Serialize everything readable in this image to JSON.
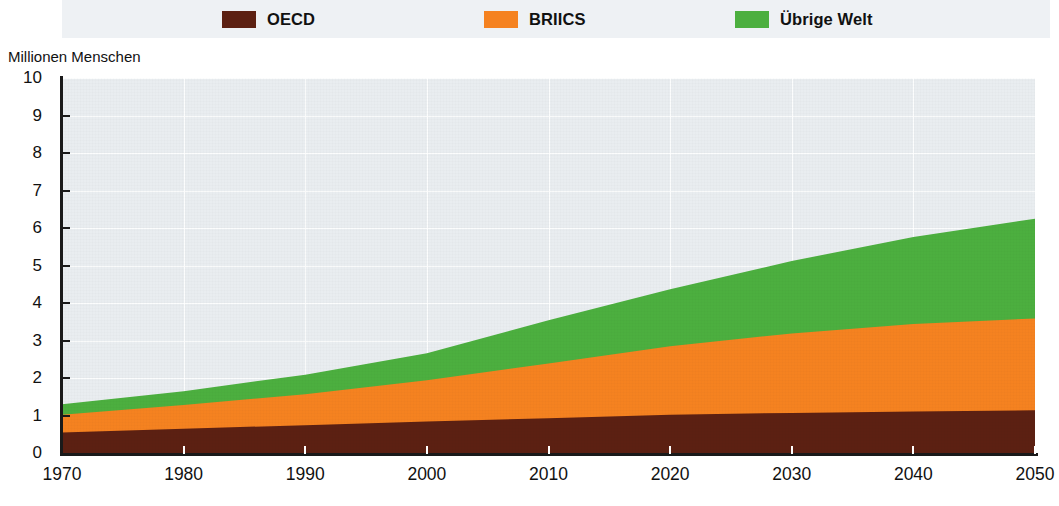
{
  "legend": {
    "items": [
      {
        "label": "OECD",
        "color": "#5c2012",
        "swatch_name": "legend-swatch-oecd"
      },
      {
        "label": "BRIICS",
        "color": "#f58220",
        "swatch_name": "legend-swatch-briics"
      },
      {
        "label": "Übrige Welt",
        "color": "#4caf3f",
        "swatch_name": "legend-swatch-uebrige-welt"
      }
    ]
  },
  "axes": {
    "ylabel": "Millionen Menschen",
    "yticks": [
      "10",
      "9",
      "8",
      "7",
      "6",
      "5",
      "4",
      "3",
      "2",
      "1",
      "0"
    ],
    "xticks": [
      "1970",
      "1980",
      "1990",
      "2000",
      "2010",
      "2020",
      "2030",
      "2040",
      "2050"
    ]
  },
  "chart_data": {
    "type": "area",
    "stacked": true,
    "title": "",
    "subtitle": "",
    "xlabel": "",
    "ylabel": "Millionen Menschen",
    "xlim": [
      1970,
      2050
    ],
    "ylim": [
      0,
      10
    ],
    "grid": true,
    "legend_position": "top",
    "x": [
      1970,
      1980,
      1990,
      2000,
      2010,
      2020,
      2030,
      2040,
      2050
    ],
    "series": [
      {
        "name": "OECD",
        "color": "#5c2012",
        "values": [
          0.55,
          0.65,
          0.74,
          0.84,
          0.93,
          1.02,
          1.07,
          1.11,
          1.14
        ]
      },
      {
        "name": "BRIICS",
        "color": "#f58220",
        "values": [
          0.47,
          0.63,
          0.83,
          1.1,
          1.46,
          1.83,
          2.12,
          2.33,
          2.45
        ]
      },
      {
        "name": "Übrige Welt",
        "color": "#4caf3f",
        "values": [
          0.28,
          0.37,
          0.52,
          0.72,
          1.15,
          1.52,
          1.93,
          2.32,
          2.66
        ]
      }
    ],
    "cumulative_tops": {
      "OECD": [
        0.55,
        0.65,
        0.74,
        0.84,
        0.93,
        1.02,
        1.07,
        1.11,
        1.14
      ],
      "BRIICS": [
        1.02,
        1.28,
        1.57,
        1.94,
        2.39,
        2.85,
        3.19,
        3.44,
        3.59
      ],
      "Übrige Welt": [
        1.3,
        1.65,
        2.09,
        2.66,
        3.54,
        4.37,
        5.12,
        5.76,
        6.25
      ]
    },
    "background_color": "#e9edf0",
    "gridline_color": "#ffffff"
  }
}
